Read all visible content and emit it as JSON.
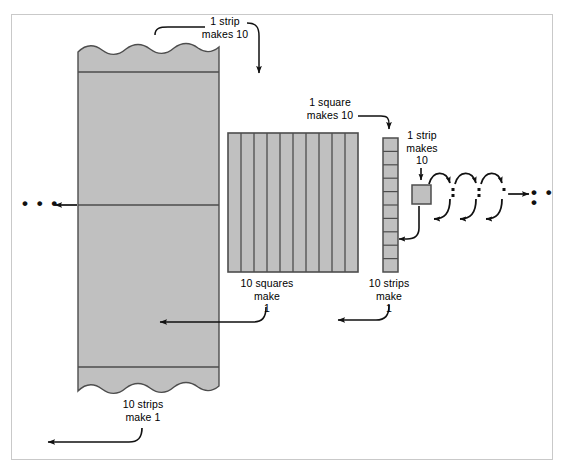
{
  "figure": {
    "border_color": "#c9c9c9",
    "fill_color": "#c0c0c0",
    "stroke_color": "#4d4d4d",
    "ink_color": "#111111"
  },
  "labels": {
    "one_strip_makes_10": "1 strip\nmakes 10",
    "one_square_makes_10": "1 square\nmakes 10",
    "one_strip_makes_10_small": "1 strip\nmakes\n10",
    "ten_strips_make_1_left": "10 strips\nmake 1",
    "ten_squares_make_1": "10 squares\nmake\n1",
    "ten_strips_make_1_right": "10 strips\nmake\n1",
    "ellipsis_left": "• • •",
    "ellipsis_right": "• • •"
  },
  "shapes": {
    "big_block": {
      "name": "large-flat-block",
      "description": "tall grey block with torn wavy top and bottom edges and horizontal division lines",
      "x": 78,
      "y": 44,
      "width": 141,
      "height": 350,
      "divider_count": 3
    },
    "square_grid": {
      "name": "ten-strip-square",
      "description": "square partitioned into 10 vertical strips",
      "x": 228,
      "y": 133,
      "width": 130,
      "height": 139,
      "columns": 10
    },
    "strip": {
      "name": "ten-square-strip",
      "description": "narrow vertical strip partitioned into 10 unit squares",
      "x": 383,
      "y": 138,
      "width": 15,
      "height": 134,
      "rows": 10
    },
    "unit_square": {
      "name": "unit-square",
      "description": "single small unit square",
      "x": 412,
      "y": 185,
      "width": 19,
      "height": 19
    }
  },
  "arrows": [
    {
      "name": "arrow-one-strip-makes-10",
      "direction": "down-right",
      "from": "big-block-top",
      "to": "square-grid"
    },
    {
      "name": "arrow-one-square-makes-10",
      "direction": "right-down",
      "from": "square-grid",
      "to": "strip"
    },
    {
      "name": "arrow-one-strip-makes-10-small",
      "direction": "down",
      "from": "strip",
      "to": "unit-square"
    },
    {
      "name": "arrow-ten-strips-make-1-left",
      "direction": "left",
      "from": "big-block",
      "to": "ellipsis-left"
    },
    {
      "name": "arrow-ten-squares-make-1",
      "direction": "left",
      "from": "square-grid",
      "to": "big-block"
    },
    {
      "name": "arrow-ten-strips-make-1-right",
      "direction": "left",
      "from": "strip",
      "to": "square-grid"
    },
    {
      "name": "arrow-unit-square-back",
      "direction": "left",
      "from": "unit-square",
      "to": "strip"
    },
    {
      "name": "arrow-chain-forward",
      "direction": "right",
      "from": "unit-square",
      "to": "ellipsis-right"
    }
  ]
}
